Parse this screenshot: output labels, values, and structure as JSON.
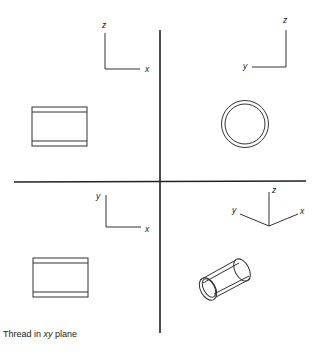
{
  "figure": {
    "caption": {
      "prefix": "Thread in ",
      "plane": "xy",
      "suffix": " plane"
    },
    "quadrants": {
      "front_view": {
        "axes": {
          "vertical": "z",
          "horizontal": "x"
        },
        "shape": "rectangle-with-thread-lines"
      },
      "side_view": {
        "axes": {
          "vertical": "z",
          "horizontal": "y"
        },
        "shape": "double-circle"
      },
      "top_view": {
        "axes": {
          "vertical": "y",
          "horizontal": "x"
        },
        "shape": "rectangle-with-thread-lines"
      },
      "isometric_view": {
        "axes": {
          "up": "z",
          "left": "y",
          "right": "x"
        },
        "shape": "cylinder"
      }
    },
    "colors": {
      "line": "#222222",
      "background": "#ffffff"
    }
  }
}
